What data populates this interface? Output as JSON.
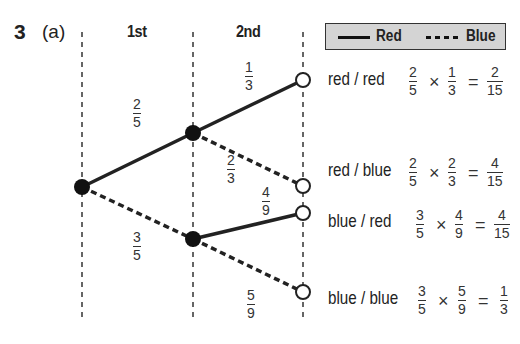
{
  "question": {
    "number": "3",
    "part": "(a)"
  },
  "columns": {
    "first": "1st",
    "second": "2nd"
  },
  "legend": {
    "solid_label": "Red",
    "dashed_label": "Blue"
  },
  "branches": {
    "first_red": {
      "num": "2",
      "den": "5"
    },
    "first_blue": {
      "num": "3",
      "den": "5"
    },
    "red_red": {
      "num": "1",
      "den": "3"
    },
    "red_blue": {
      "num": "2",
      "den": "3"
    },
    "blue_red": {
      "num": "4",
      "den": "9"
    },
    "blue_blue": {
      "num": "5",
      "den": "9"
    }
  },
  "outcomes": [
    {
      "label": "red / red",
      "a": {
        "num": "2",
        "den": "5"
      },
      "b": {
        "num": "1",
        "den": "3"
      },
      "result": {
        "num": "2",
        "den": "15"
      }
    },
    {
      "label": "red / blue",
      "a": {
        "num": "2",
        "den": "5"
      },
      "b": {
        "num": "2",
        "den": "3"
      },
      "result": {
        "num": "4",
        "den": "15"
      }
    },
    {
      "label": "blue / red",
      "a": {
        "num": "3",
        "den": "5"
      },
      "b": {
        "num": "4",
        "den": "9"
      },
      "result": {
        "num": "4",
        "den": "15"
      }
    },
    {
      "label": "blue / blue",
      "a": {
        "num": "3",
        "den": "5"
      },
      "b": {
        "num": "5",
        "den": "9"
      },
      "result": {
        "num": "1",
        "den": "3"
      }
    }
  ],
  "symbols": {
    "times": "×",
    "equals": "="
  }
}
